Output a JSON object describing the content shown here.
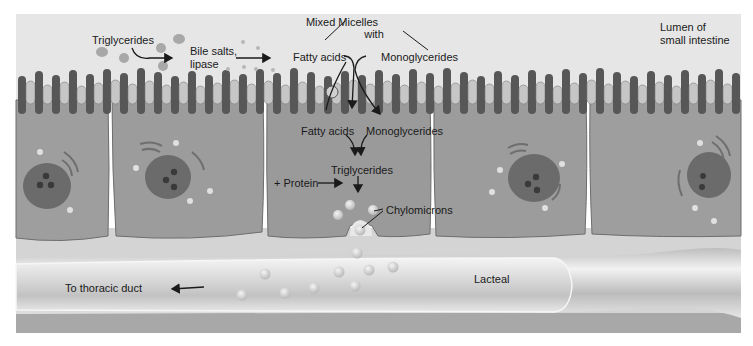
{
  "figure": {
    "colors": {
      "background": "#ffffff",
      "lumen": "#e6e6e6",
      "cell": "#9c9c9c",
      "cell_outline": "#6e6e6e",
      "microvillus_dark": "#555555",
      "microvillus_light": "#c4c4c4",
      "nucleus": "#6a6a6a",
      "nucleolus": "#3a3a3a",
      "lamina": "#d2d2d2",
      "lacteal_wall": "#f2f2f2",
      "lacteal_lumen": "#c8c8c8",
      "droplet": "#d0d0d0",
      "text": "#1a1a1a"
    }
  },
  "labels": {
    "lumen": [
      "Lumen of",
      "small intestine"
    ],
    "triglycerides_lumen": "Triglycerides",
    "bile_salts": [
      "Bile salts,",
      "lipase"
    ],
    "mixed_micelles": [
      "Mixed Micelles",
      "with"
    ],
    "fatty_acids_lumen": "Fatty acids",
    "monoglycerides_lumen": "Monoglycerides",
    "fatty_acids_cell": "Fatty acids",
    "monoglycerides_cell": "Monoglycerides",
    "triglycerides_cell": "Triglycerides",
    "protein": "+ Protein",
    "chylomicrons": "Chylomicrons",
    "lacteal": "Lacteal",
    "thoracic_duct": "To thoracic duct"
  },
  "structures": {
    "cells": [
      {
        "name": "epithelial-cell-1",
        "x0": 16,
        "x1": 110
      },
      {
        "name": "epithelial-cell-2",
        "x0": 110,
        "x1": 265
      },
      {
        "name": "epithelial-cell-3",
        "x0": 265,
        "x1": 432
      },
      {
        "name": "epithelial-cell-4",
        "x0": 432,
        "x1": 588
      },
      {
        "name": "epithelial-cell-5",
        "x0": 588,
        "x1": 741
      }
    ],
    "nuclei_count": 4
  }
}
